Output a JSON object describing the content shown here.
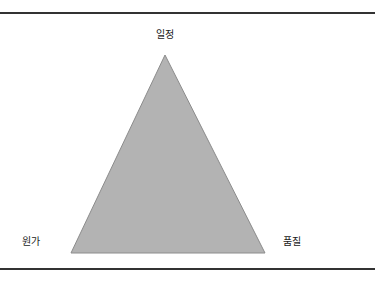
{
  "figure": {
    "background_color": "#ffffff",
    "width": 375,
    "height": 285
  },
  "rules": {
    "color": "#333333",
    "top_y": 12,
    "bottom_y": 268,
    "thickness": 2
  },
  "triangle": {
    "fill_color": "#b3b3b3",
    "stroke_color": "#8c8c8c",
    "apex": {
      "x": 165,
      "y": 55
    },
    "bottom_left": {
      "x": 71,
      "y": 253
    },
    "bottom_right": {
      "x": 265,
      "y": 253
    },
    "points": "165,55 265,253 71,253"
  },
  "labels": {
    "apex": "일정",
    "bottom_left": "원가",
    "bottom_right": "품질",
    "text_color": "#1a1a1a"
  },
  "chart_data": {
    "type": "diagram",
    "title": "",
    "shape": "triangle",
    "vertices": [
      {
        "name": "일정",
        "position": "top",
        "x": 165,
        "y": 55
      },
      {
        "name": "원가",
        "position": "bottom-left",
        "x": 71,
        "y": 253
      },
      {
        "name": "품질",
        "position": "bottom-right",
        "x": 265,
        "y": 253
      }
    ],
    "annotations": []
  }
}
